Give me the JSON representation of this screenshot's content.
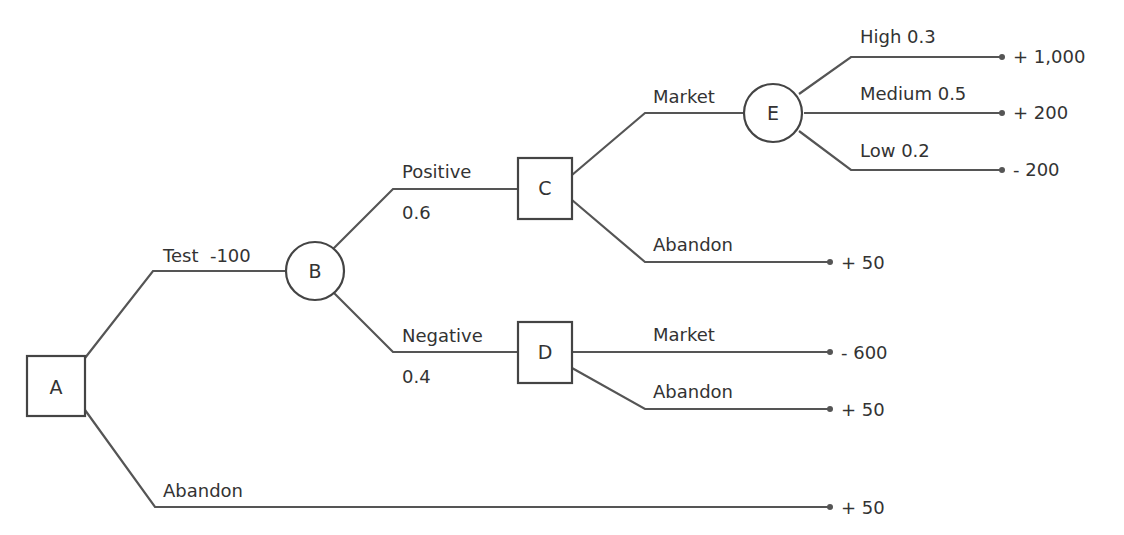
{
  "header": {
    "cut_text": ""
  },
  "nodes": [
    {
      "id": "A",
      "type": "decision",
      "label": "A"
    },
    {
      "id": "B",
      "type": "chance",
      "label": "B"
    },
    {
      "id": "C",
      "type": "decision",
      "label": "C"
    },
    {
      "id": "D",
      "type": "decision",
      "label": "D"
    },
    {
      "id": "E",
      "type": "chance",
      "label": "E"
    }
  ],
  "edges": {
    "a_test": {
      "label": "Test  -100"
    },
    "a_abandon": {
      "label": "Abandon",
      "payoff": "+ 50"
    },
    "b_positive": {
      "label": "Positive",
      "prob": "0.6"
    },
    "b_negative": {
      "label": "Negative",
      "prob": "0.4"
    },
    "c_market": {
      "label": "Market"
    },
    "c_abandon": {
      "label": "Abandon",
      "payoff": "+ 50"
    },
    "d_market": {
      "label": "Market",
      "payoff": "- 600"
    },
    "d_abandon": {
      "label": "Abandon",
      "payoff": "+ 50"
    },
    "e_high": {
      "label": "High 0.3",
      "payoff": "+ 1,000"
    },
    "e_medium": {
      "label": "Medium 0.5",
      "payoff": "+ 200"
    },
    "e_low": {
      "label": "Low 0.2",
      "payoff": "- 200"
    }
  }
}
